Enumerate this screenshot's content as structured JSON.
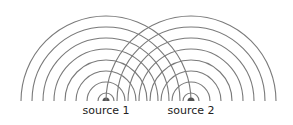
{
  "diagram": {
    "stroke_color": "#7a7a7a",
    "source_color": "#555555",
    "baseline_y": 101,
    "radii": [
      8,
      19,
      30,
      41,
      52,
      63,
      74,
      85
    ],
    "sources": [
      {
        "label": "source 1",
        "x": 106
      },
      {
        "label": "source 2",
        "x": 191
      }
    ]
  }
}
